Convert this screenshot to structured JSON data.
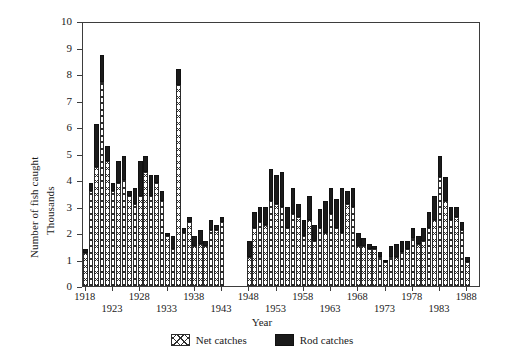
{
  "chart_data": {
    "type": "bar",
    "stacked": true,
    "title": "",
    "xlabel": "Year",
    "ylabel_lines": [
      "Number of fish caught",
      "Thousands"
    ],
    "ylim": [
      0,
      10
    ],
    "yticks": [
      0,
      1,
      2,
      3,
      4,
      5,
      6,
      7,
      8,
      9,
      10
    ],
    "ytick_labels": [
      "0",
      "1",
      "2",
      "3",
      "4",
      "5",
      "6",
      "7",
      "8",
      "9",
      "10"
    ],
    "grid": false,
    "legend_position": "below",
    "xtick_labels_row1": [
      "1918",
      "1928",
      "1938",
      "1948",
      "1958",
      "1968",
      "1978",
      "1988"
    ],
    "xtick_labels_row2": [
      "1923",
      "1933",
      "1943",
      "1953",
      "1963",
      "1973",
      "1983"
    ],
    "x_range": [
      1918,
      1990
    ],
    "data_gap_years": [
      1944,
      1945,
      1946,
      1947
    ],
    "series": [
      {
        "name": "Net catches",
        "pattern": "cross-hatch",
        "color": "#ffffff",
        "values": [
          1.25,
          3.6,
          4.5,
          7.7,
          4.7,
          3.6,
          3.9,
          4.0,
          3.4,
          3.1,
          3.4,
          4.3,
          3.4,
          3.9,
          3.2,
          1.9,
          1.4,
          7.6,
          2.0,
          2.4,
          1.5,
          1.6,
          1.5,
          2.1,
          2.1,
          2.4,
          1.1,
          2.2,
          2.4,
          2.3,
          3.2,
          3.1,
          3.0,
          2.2,
          2.7,
          2.6,
          1.9,
          2.5,
          1.7,
          2.2,
          2.0,
          2.7,
          2.2,
          2.0,
          3.1,
          3.0,
          1.5,
          1.5,
          1.4,
          1.4,
          1.1,
          0.9,
          1.1,
          1.1,
          1.3,
          1.4,
          1.8,
          1.6,
          1.7,
          2.2,
          2.5,
          4.1,
          3.2,
          2.5,
          2.6,
          2.1,
          0.9
        ]
      },
      {
        "name": "Rod catches",
        "pattern": "solid",
        "color": "#1b1b1b",
        "values": [
          0.15,
          0.3,
          1.6,
          1.0,
          0.6,
          0.3,
          0.8,
          0.9,
          0.2,
          0.6,
          1.3,
          0.6,
          0.8,
          0.3,
          0.4,
          0.1,
          0.5,
          0.6,
          0.2,
          0.2,
          0.4,
          0.5,
          0.2,
          0.4,
          0.2,
          0.2,
          0.6,
          0.6,
          0.6,
          0.7,
          1.2,
          1.1,
          1.3,
          0.8,
          1.0,
          0.5,
          0.6,
          0.9,
          0.6,
          0.7,
          1.2,
          1.0,
          1.1,
          1.7,
          0.5,
          0.7,
          0.5,
          0.3,
          0.2,
          0.1,
          0.2,
          0.1,
          0.4,
          0.5,
          0.4,
          0.3,
          0.4,
          0.3,
          0.5,
          0.6,
          0.9,
          0.8,
          0.9,
          0.5,
          0.4,
          0.3,
          0.2
        ]
      }
    ],
    "years": [
      1918,
      1919,
      1920,
      1921,
      1922,
      1923,
      1924,
      1925,
      1926,
      1927,
      1928,
      1929,
      1930,
      1931,
      1932,
      1933,
      1934,
      1935,
      1936,
      1937,
      1938,
      1939,
      1940,
      1941,
      1942,
      1943,
      1948,
      1949,
      1950,
      1951,
      1952,
      1953,
      1954,
      1955,
      1956,
      1957,
      1958,
      1959,
      1960,
      1961,
      1962,
      1963,
      1964,
      1965,
      1966,
      1967,
      1968,
      1969,
      1970,
      1971,
      1972,
      1973,
      1974,
      1975,
      1976,
      1977,
      1978,
      1979,
      1980,
      1981,
      1982,
      1983,
      1984,
      1985,
      1986,
      1987,
      1988
    ]
  },
  "legend": {
    "items": [
      {
        "label": "Net catches",
        "swatch": "cross-hatch-swatch"
      },
      {
        "label": "Rod catches",
        "swatch": "solid-black-swatch"
      }
    ]
  }
}
